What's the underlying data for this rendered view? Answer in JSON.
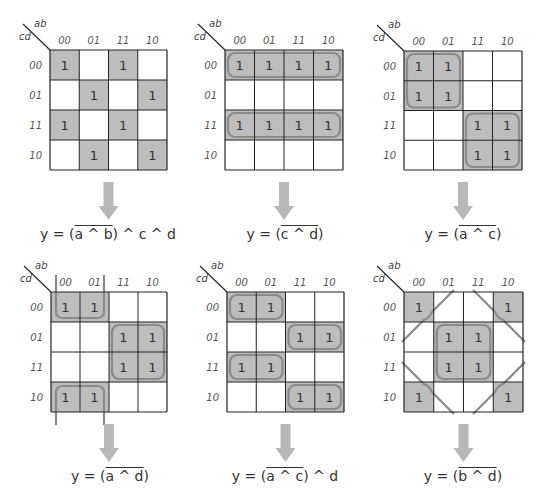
{
  "colors": {
    "cell_fill": "#bdbdbd",
    "group_stroke": "#8a8a8a",
    "grid_line": "#222222",
    "arrow": "#b8b8b8"
  },
  "corner_labels": {
    "top": "ab",
    "left": "cd"
  },
  "column_labels": [
    "00",
    "01",
    "11",
    "10"
  ],
  "row_labels": [
    "00",
    "01",
    "11",
    "10"
  ],
  "maps": [
    {
      "id": "map-1",
      "x": 50,
      "y": 50,
      "w": 117,
      "h": 120,
      "ones": [
        [
          1,
          0,
          1,
          0
        ],
        [
          0,
          1,
          0,
          1
        ],
        [
          1,
          0,
          1,
          0
        ],
        [
          0,
          1,
          0,
          1
        ]
      ],
      "groups": [],
      "equation": {
        "prefix": "y = (",
        "over": "a ^ b",
        "suffix": ") ^ c ^ d"
      }
    },
    {
      "id": "map-2",
      "x": 225,
      "y": 50,
      "w": 118,
      "h": 120,
      "ones": [
        [
          1,
          1,
          1,
          1
        ],
        [
          0,
          0,
          0,
          0
        ],
        [
          1,
          1,
          1,
          1
        ],
        [
          0,
          0,
          0,
          0
        ]
      ],
      "groups": [
        {
          "type": "rect",
          "r0": 0,
          "c0": 0,
          "r1": 0,
          "c1": 3
        },
        {
          "type": "rect",
          "r0": 2,
          "c0": 0,
          "r1": 2,
          "c1": 3
        }
      ],
      "equation": {
        "prefix": "y = (",
        "over": "c ^ d",
        "suffix": ")"
      }
    },
    {
      "id": "map-3",
      "x": 404,
      "y": 51,
      "w": 118,
      "h": 119,
      "ones": [
        [
          1,
          1,
          0,
          0
        ],
        [
          1,
          1,
          0,
          0
        ],
        [
          0,
          0,
          1,
          1
        ],
        [
          0,
          0,
          1,
          1
        ]
      ],
      "groups": [
        {
          "type": "rect",
          "r0": 0,
          "c0": 0,
          "r1": 1,
          "c1": 1
        },
        {
          "type": "rect",
          "r0": 2,
          "c0": 2,
          "r1": 3,
          "c1": 3
        }
      ],
      "equation": {
        "prefix": "y = (",
        "over": "a ^ c",
        "suffix": ")"
      }
    },
    {
      "id": "map-4",
      "x": 51,
      "y": 292,
      "w": 116,
      "h": 120,
      "ones": [
        [
          1,
          1,
          0,
          0
        ],
        [
          0,
          0,
          1,
          1
        ],
        [
          0,
          0,
          1,
          1
        ],
        [
          1,
          1,
          0,
          0
        ]
      ],
      "groups": [
        {
          "type": "rect",
          "r0": 1,
          "c0": 2,
          "r1": 2,
          "c1": 3
        },
        {
          "type": "wrap-vertical",
          "c0": 0,
          "c1": 1,
          "top_row": 0,
          "bottom_row": 3
        }
      ],
      "equation": {
        "prefix": "y = (",
        "over": "a ^ d",
        "suffix": ")"
      }
    },
    {
      "id": "map-5",
      "x": 227,
      "y": 292,
      "w": 117,
      "h": 120,
      "ones": [
        [
          1,
          1,
          0,
          0
        ],
        [
          0,
          0,
          1,
          1
        ],
        [
          1,
          1,
          0,
          0
        ],
        [
          0,
          0,
          1,
          1
        ]
      ],
      "groups": [
        {
          "type": "rect",
          "r0": 0,
          "c0": 0,
          "r1": 0,
          "c1": 1
        },
        {
          "type": "rect",
          "r0": 1,
          "c0": 2,
          "r1": 1,
          "c1": 3
        },
        {
          "type": "rect",
          "r0": 2,
          "c0": 0,
          "r1": 2,
          "c1": 1
        },
        {
          "type": "rect",
          "r0": 3,
          "c0": 2,
          "r1": 3,
          "c1": 3
        }
      ],
      "equation": {
        "prefix": "y = (",
        "over": "a ^ c",
        "suffix": ") ^ d"
      }
    },
    {
      "id": "map-6",
      "x": 404,
      "y": 292,
      "w": 119,
      "h": 120,
      "ones": [
        [
          1,
          0,
          0,
          1
        ],
        [
          0,
          1,
          1,
          0
        ],
        [
          0,
          1,
          1,
          0
        ],
        [
          1,
          0,
          0,
          1
        ]
      ],
      "groups": [
        {
          "type": "rect",
          "r0": 1,
          "c0": 1,
          "r1": 2,
          "c1": 2
        },
        {
          "type": "corners"
        }
      ],
      "equation": {
        "prefix": "y = (",
        "over": "b ^ d",
        "suffix": ")"
      }
    }
  ]
}
